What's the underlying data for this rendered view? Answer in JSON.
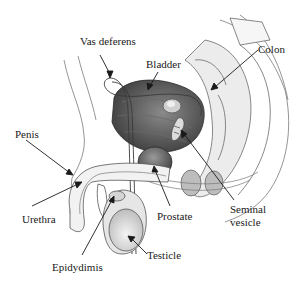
{
  "diagram": {
    "type": "anatomical-illustration",
    "labels": [
      {
        "id": "vas-deferens",
        "text": "Vas deferens",
        "x": 80,
        "y": 41
      },
      {
        "id": "bladder",
        "text": "Bladder",
        "x": 145,
        "y": 62
      },
      {
        "id": "colon",
        "text": "Colon",
        "x": 258,
        "y": 44
      },
      {
        "id": "penis",
        "text": "Penis",
        "x": 14,
        "y": 130
      },
      {
        "id": "urethra",
        "text": "Urethra",
        "x": 22,
        "y": 214
      },
      {
        "id": "prostate",
        "text": "Prostate",
        "x": 157,
        "y": 211
      },
      {
        "id": "seminal-vesicle",
        "text": "Seminal",
        "text2": "vesicle",
        "x": 229,
        "y": 202
      },
      {
        "id": "testicle",
        "text": "Testicle",
        "x": 133,
        "y": 250
      },
      {
        "id": "epidydimis",
        "text": "Epidydimis",
        "x": 52,
        "y": 262
      }
    ],
    "colors": {
      "background": "#ffffff",
      "line": "#2a2a2a",
      "organ_dark": "#5a5a5a",
      "organ_mid": "#9a9a9a",
      "organ_light": "#d8d8d8"
    }
  }
}
